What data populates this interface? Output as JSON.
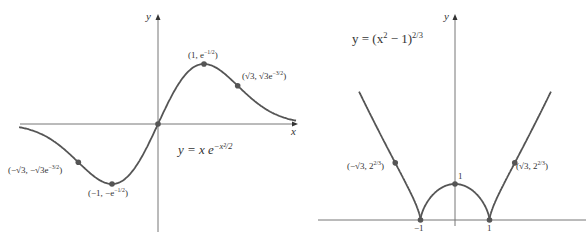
{
  "left_graph": {
    "function": "y = x e^{-x^2/2}",
    "equation_label": {
      "pre": "y = x e",
      "sup": "−x²/2"
    },
    "axis_x_label": "x",
    "axis_y_label": "y",
    "points": [
      {
        "id": "origin",
        "x": 0,
        "y": 0,
        "label": ""
      },
      {
        "id": "max",
        "x": 1,
        "y": 0.6065,
        "label_pre": "(1, e",
        "label_sup": "−1/2",
        "label_post": ")"
      },
      {
        "id": "inflect-pos",
        "x": 1.732,
        "y": 0.3865,
        "label_pre": "(√3, √3e",
        "label_sup": "−3/2",
        "label_post": ")"
      },
      {
        "id": "min",
        "x": -1,
        "y": -0.6065,
        "label_pre": "(−1, −e",
        "label_sup": "−1/2",
        "label_post": ")"
      },
      {
        "id": "inflect-neg",
        "x": -1.732,
        "y": -0.3865,
        "label_pre": "(−√3, −√3e",
        "label_sup": "−3/2",
        "label_post": ")"
      }
    ],
    "colors": {
      "curve": "#555555",
      "axis": "#777777",
      "point": "#555555"
    }
  },
  "right_graph": {
    "function": "y = (x^2 - 1)^{2/3}",
    "equation_label": {
      "pre": "y = (x",
      "sup1": "2",
      "mid": " − 1)",
      "sup2": "2/3"
    },
    "axis_y_label": "y",
    "tick_labels": {
      "neg_one": "−1",
      "one": "1",
      "y_one": "1"
    },
    "points": [
      {
        "id": "neg-one",
        "x": -1,
        "y": 0,
        "label": "−1"
      },
      {
        "id": "one",
        "x": 1,
        "y": 0,
        "label": "1"
      },
      {
        "id": "y-intercept",
        "x": 0,
        "y": 1,
        "label": "1"
      },
      {
        "id": "inflect-pos",
        "x": 1.732,
        "y": 1.587,
        "label_pre": "(√3, 2",
        "label_sup": "2/3",
        "label_post": ")"
      },
      {
        "id": "inflect-neg",
        "x": -1.732,
        "y": 1.587,
        "label_pre": "(−√3, 2",
        "label_sup": "2/3",
        "label_post": ")"
      }
    ],
    "colors": {
      "curve": "#555555",
      "axis": "#777777",
      "point": "#555555"
    }
  }
}
